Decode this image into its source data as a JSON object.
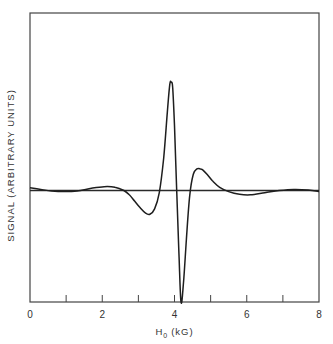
{
  "chart_data": {
    "type": "line",
    "title": "",
    "xlabel": "H",
    "xlabel_subscript": "0",
    "xlabel_unit": "(kG)",
    "ylabel": "SIGNAL  (ARBITRARY UNITS)",
    "xlim": [
      0,
      8
    ],
    "ylim": [
      -1.03,
      1.64
    ],
    "x_ticks": [
      0,
      1,
      2,
      3,
      4,
      5,
      6,
      7,
      8
    ],
    "x_tick_labels": [
      "0",
      "2",
      "4",
      "6",
      "8"
    ],
    "x_tick_label_values": [
      0,
      2,
      4,
      6,
      8
    ],
    "y_ticks": [],
    "grid": false,
    "legend": "none",
    "baseline": 0,
    "series": [
      {
        "name": "signal",
        "x": [
          0,
          0.3,
          0.6,
          0.95,
          1.3,
          1.7,
          2.05,
          2.35,
          2.6,
          2.75,
          2.9,
          3.05,
          3.2,
          3.32,
          3.45,
          3.58,
          3.7,
          3.8,
          3.87,
          3.91,
          3.95,
          4.0,
          4.06,
          4.12,
          4.18,
          4.25,
          4.33,
          4.42,
          4.52,
          4.62,
          4.72,
          4.78,
          4.9,
          5.05,
          5.25,
          5.5,
          5.8,
          6.1,
          6.5,
          6.9,
          7.3,
          7.7,
          8.0
        ],
        "y": [
          0.025,
          0.01,
          -0.005,
          -0.01,
          -0.005,
          0.02,
          0.035,
          0.03,
          0.0,
          -0.04,
          -0.1,
          -0.16,
          -0.21,
          -0.22,
          -0.17,
          -0.02,
          0.3,
          0.72,
          0.98,
          1.0,
          0.95,
          0.6,
          0.0,
          -0.55,
          -1.03,
          -0.85,
          -0.45,
          -0.05,
          0.15,
          0.2,
          0.2,
          0.19,
          0.15,
          0.09,
          0.03,
          -0.01,
          -0.035,
          -0.04,
          -0.02,
          0.0,
          0.01,
          0.005,
          -0.01
        ]
      }
    ]
  }
}
